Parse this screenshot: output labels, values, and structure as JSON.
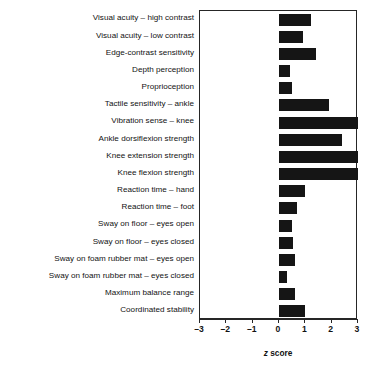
{
  "chart_data": {
    "type": "bar",
    "orientation": "horizontal",
    "title": "",
    "subtitle": "",
    "xlabel": "z score",
    "ylabel": "",
    "xlim": [
      -3,
      3
    ],
    "xticks": [
      -3,
      -2,
      -1,
      0,
      1,
      2,
      3
    ],
    "xticklabels": [
      "–3",
      "–2",
      "–1",
      "0",
      "1",
      "2",
      "3"
    ],
    "grid": false,
    "legend": null,
    "bar_color": "#151515",
    "frame_color": "#262626",
    "categories": [
      "Visual acuity – high contrast",
      "Visual acuity – low contrast",
      "Edge-contrast sensitivity",
      "Depth perception",
      "Proprioception",
      "Tactile sensitivity – ankle",
      "Vibration sense – knee",
      "Ankle dorsiflexion strength",
      "Knee extension strength",
      "Knee flexion strength",
      "Reaction time – hand",
      "Reaction time – foot",
      "Sway on floor – eyes open",
      "Sway on floor – eyes closed",
      "Sway on foam rubber mat – eyes open",
      "Sway on foam rubber mat – eyes closed",
      "Maximum balance range",
      "Coordinated stability"
    ],
    "values": [
      1.2,
      0.9,
      1.4,
      0.4,
      0.5,
      1.9,
      3.0,
      2.4,
      3.0,
      3.0,
      1.0,
      0.7,
      0.5,
      0.55,
      0.6,
      0.3,
      0.6,
      1.0
    ]
  }
}
